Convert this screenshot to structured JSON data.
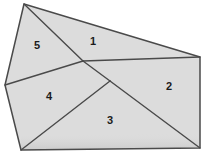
{
  "figure": {
    "background_color": "#ffffff",
    "fill_color": "#dcdcdc",
    "stroke_color": "#4a4a4a",
    "shadow_color": "#c2c2c2",
    "label_color": "#1b1b1b",
    "outline": {
      "points": "24,4 200,57 200,148 21,150 5,85",
      "vertices": [
        {
          "name": "top-apex",
          "x": 24,
          "y": 4
        },
        {
          "name": "right-top",
          "x": 200,
          "y": 57
        },
        {
          "name": "right-bottom",
          "x": 200,
          "y": 148
        },
        {
          "name": "bottom-left",
          "x": 21,
          "y": 150
        },
        {
          "name": "left-mid",
          "x": 5,
          "y": 85
        }
      ]
    },
    "interior_nodes": [
      {
        "name": "upper-junction",
        "x": 83,
        "y": 61
      },
      {
        "name": "lower-junction",
        "x": 110,
        "y": 81
      }
    ],
    "regions": [
      {
        "id": "region-1",
        "label": "1",
        "points": "24,4 200,57 83,61",
        "label_x": 93,
        "label_y": 42
      },
      {
        "id": "region-2",
        "label": "2",
        "points": "83,61 200,57 200,148 110,81",
        "label_x": 169,
        "label_y": 87
      },
      {
        "id": "region-3",
        "label": "3",
        "points": "110,81 200,148 21,150",
        "label_x": 110,
        "label_y": 121
      },
      {
        "id": "region-4",
        "label": "4",
        "points": "5,85 83,61 110,81 21,150",
        "label_x": 49,
        "label_y": 97
      },
      {
        "id": "region-5",
        "label": "5",
        "points": "24,4 83,61 5,85",
        "label_x": 37,
        "label_y": 46
      }
    ],
    "interior_edges": [
      {
        "name": "edge-apex-to-upper-junction",
        "x1": 24,
        "y1": 4,
        "x2": 83,
        "y2": 61
      },
      {
        "name": "edge-upper-junction-to-right-top",
        "x1": 83,
        "y1": 61,
        "x2": 200,
        "y2": 57
      },
      {
        "name": "edge-left-mid-to-upper-junction",
        "x1": 5,
        "y1": 85,
        "x2": 83,
        "y2": 61
      },
      {
        "name": "edge-upper-junction-to-lower-junction",
        "x1": 83,
        "y1": 61,
        "x2": 110,
        "y2": 81
      },
      {
        "name": "edge-lower-junction-to-right-bottom",
        "x1": 110,
        "y1": 81,
        "x2": 200,
        "y2": 148
      },
      {
        "name": "edge-lower-junction-to-bottom-left",
        "x1": 110,
        "y1": 81,
        "x2": 21,
        "y2": 150
      }
    ]
  }
}
